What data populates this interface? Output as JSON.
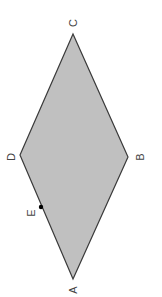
{
  "diagram": {
    "type": "rhombus",
    "fill_color": "#c0c0c0",
    "stroke_color": "#3a3a3a",
    "label_color": "#444444",
    "label_rotation_deg": -90,
    "vertices": [
      {
        "name": "A",
        "x": 73,
        "y": 279,
        "label_x": 73,
        "label_y": 290
      },
      {
        "name": "B",
        "x": 128,
        "y": 157,
        "label_x": 140,
        "label_y": 157
      },
      {
        "name": "C",
        "x": 73,
        "y": 34,
        "label_x": 73,
        "label_y": 23
      },
      {
        "name": "D",
        "x": 20,
        "y": 155,
        "label_x": 11,
        "label_y": 157
      }
    ],
    "points": [
      {
        "name": "E",
        "on_segment": "AD",
        "x": 41,
        "y": 207,
        "label_x": 31,
        "label_y": 213
      }
    ]
  }
}
